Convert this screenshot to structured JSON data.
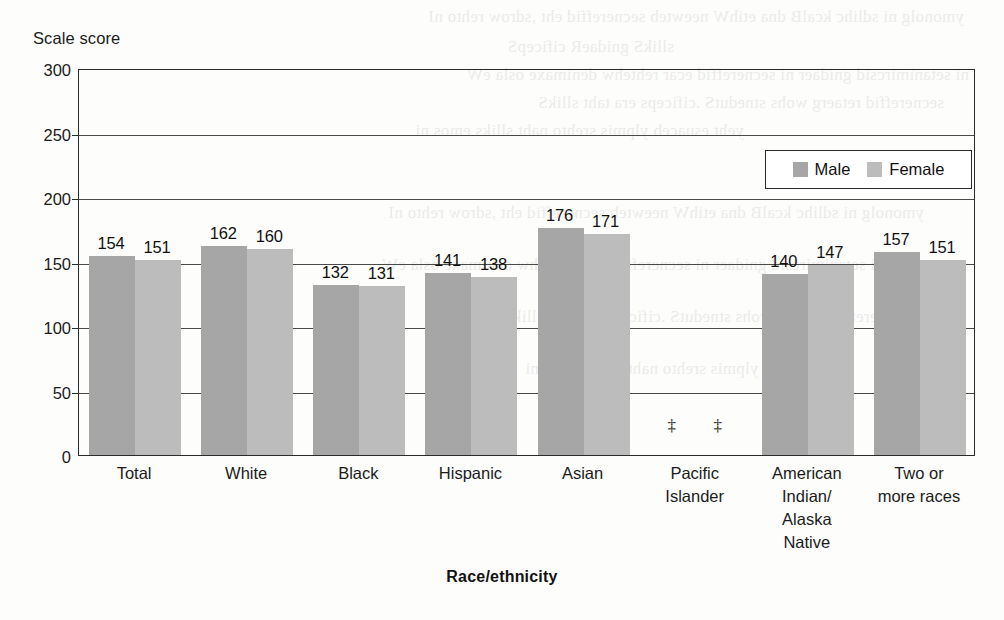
{
  "chart_data": {
    "type": "bar",
    "title": "",
    "xlabel": "Race/ethnicity",
    "ylabel": "Scale score",
    "ylim": [
      0,
      300
    ],
    "yticks": [
      0,
      50,
      100,
      150,
      200,
      250,
      300
    ],
    "grid": true,
    "legend_position": "top-right",
    "categories": [
      "Total",
      "White",
      "Black",
      "Hispanic",
      "Asian",
      "Pacific\nIslander",
      "American\nIndian/\nAlaska\nNative",
      "Two or\nmore races"
    ],
    "series": [
      {
        "name": "Male",
        "color": "#a6a6a6",
        "values": [
          154,
          162,
          132,
          141,
          176,
          null,
          140,
          157
        ],
        "labels": [
          "154",
          "162",
          "132",
          "141",
          "176",
          "‡",
          "140",
          "157"
        ]
      },
      {
        "name": "Female",
        "color": "#bcbcbc",
        "values": [
          151,
          160,
          131,
          138,
          171,
          null,
          147,
          151
        ],
        "labels": [
          "151",
          "160",
          "131",
          "138",
          "171",
          "‡",
          "147",
          "151"
        ]
      }
    ],
    "suppressed_symbol": "‡",
    "suppressed_categories": [
      "Pacific Islander"
    ]
  },
  "axis": {
    "y_title": "Scale score",
    "x_title": "Race/ethnicity",
    "y_tick_labels": [
      "300",
      "250",
      "200",
      "150",
      "100",
      "50",
      "0"
    ]
  },
  "legend": {
    "items": [
      {
        "label": "Male",
        "color": "#a6a6a6"
      },
      {
        "label": "Female",
        "color": "#bcbcbc"
      }
    ]
  },
  "bleed_through": {
    "lines": [
      "ymonolg ni  sdlihc  kcalB  dna  etihW  neewteb  secnereffid  eht  ,sdrow  rehto  nI",
      "sllikS  gnidaeR  cificepS",
      "ni  setanimircsid  gnidaer  ni  secnereffid  ecar  rehtehw  denimaxe  osla  eW",
      "secnereffid  retaerg  wohs  stnedutS  .cificeps  era  taht  sllikS",
      "yeht  esuaceb  ylpmis  srehto  naht  slliks  emos  ni"
    ]
  }
}
